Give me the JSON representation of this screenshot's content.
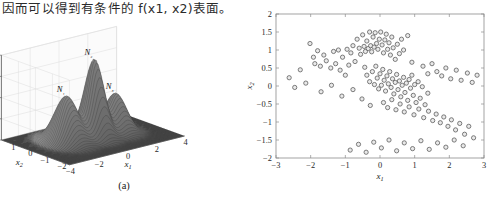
{
  "page": {
    "body_text": "因而可以得到有条件的 f(x1, x2)表面。"
  },
  "figure": {
    "panels": [
      {
        "id": "panel-a",
        "caption": "(a)",
        "type": "surface3d",
        "zlabel": "p(x₁,x₂)",
        "xlabel": "x₁",
        "ylabel": "x₂",
        "peak_labels": [
          "N₁",
          "N₂",
          "N₃"
        ]
      },
      {
        "id": "panel-b",
        "caption": "(b)",
        "type": "scatter",
        "xlabel": "x₁",
        "ylabel": "x₂"
      }
    ]
  },
  "chart_data": [
    {
      "type": "surface",
      "panel": "(a)",
      "title": "",
      "xlabel": "x₁",
      "ylabel": "x₂",
      "zlabel": "p(x₁,x₂)",
      "xlim": [
        -4,
        4
      ],
      "ylim": [
        -2,
        2
      ],
      "zlim": [
        0,
        0.4
      ],
      "xticks": [
        -4,
        -2,
        0,
        2,
        4
      ],
      "yticks": [
        -2,
        -1,
        0,
        1,
        2
      ],
      "zticks": [
        0,
        0.1,
        0.2,
        0.3,
        0.4
      ],
      "grid": true,
      "colormap": "grayscale",
      "annotations": [
        {
          "text": "N₁",
          "x": -1.6,
          "y": 0.2,
          "z": 0.22
        },
        {
          "text": "N₂",
          "x": 0.1,
          "y": 0.0,
          "z": 0.37
        },
        {
          "text": "N₃",
          "x": 1.7,
          "y": 0.1,
          "z": 0.18
        }
      ],
      "components": [
        {
          "name": "N₁",
          "mean": [
            -1.6,
            0.2
          ],
          "peak_height": 0.22,
          "sigma": [
            0.55,
            0.55
          ]
        },
        {
          "name": "N₂",
          "mean": [
            0.1,
            0.0
          ],
          "peak_height": 0.37,
          "sigma": [
            0.45,
            0.45
          ]
        },
        {
          "name": "N₃",
          "mean": [
            1.7,
            0.1
          ],
          "peak_height": 0.18,
          "sigma": [
            0.5,
            0.5
          ]
        }
      ]
    },
    {
      "type": "scatter",
      "panel": "(b)",
      "title": "",
      "xlabel": "x₁",
      "ylabel": "x₂",
      "xlim": [
        -3,
        3
      ],
      "ylim": [
        -2,
        2
      ],
      "xticks": [
        -3,
        -2,
        -1,
        0,
        1,
        2,
        3
      ],
      "yticks": [
        -2,
        -1.5,
        -1,
        -0.5,
        0,
        0.5,
        1,
        1.5,
        2
      ],
      "grid": false,
      "marker": "circle-open",
      "marker_size": 3.4,
      "marker_color": "#555555",
      "points": [
        [
          -2.62,
          0.23
        ],
        [
          -2.3,
          0.45
        ],
        [
          -2.02,
          1.18
        ],
        [
          -1.92,
          0.8
        ],
        [
          -1.88,
          0.62
        ],
        [
          -1.8,
          0.98
        ],
        [
          -1.72,
          0.55
        ],
        [
          -1.62,
          0.86
        ],
        [
          -1.55,
          0.7
        ],
        [
          -1.42,
          0.5
        ],
        [
          -1.34,
          0.96
        ],
        [
          -1.28,
          0.62
        ],
        [
          -1.2,
          1.0
        ],
        [
          -1.15,
          0.44
        ],
        [
          -1.08,
          0.8
        ],
        [
          -1.0,
          0.3
        ],
        [
          -0.95,
          1.02
        ],
        [
          -0.9,
          0.58
        ],
        [
          -0.84,
          0.92
        ],
        [
          -0.78,
          1.12
        ],
        [
          -0.72,
          0.68
        ],
        [
          -0.66,
          1.3
        ],
        [
          -0.6,
          1.05
        ],
        [
          -0.56,
          0.88
        ],
        [
          -0.5,
          1.42
        ],
        [
          -0.46,
          1.1
        ],
        [
          -0.42,
          0.96
        ],
        [
          -0.38,
          1.25
        ],
        [
          -0.34,
          1.04
        ],
        [
          -0.3,
          1.5
        ],
        [
          -0.27,
          1.12
        ],
        [
          -0.24,
          0.95
        ],
        [
          -0.2,
          1.36
        ],
        [
          -0.17,
          1.08
        ],
        [
          -0.14,
          1.48
        ],
        [
          -0.1,
          1.18
        ],
        [
          -0.06,
          1.02
        ],
        [
          -0.02,
          1.3
        ],
        [
          0.02,
          1.5
        ],
        [
          0.06,
          1.14
        ],
        [
          0.1,
          0.92
        ],
        [
          0.14,
          1.28
        ],
        [
          0.18,
          1.44
        ],
        [
          0.22,
          1.02
        ],
        [
          0.26,
          1.2
        ],
        [
          0.3,
          0.86
        ],
        [
          0.34,
          1.36
        ],
        [
          0.38,
          1.06
        ],
        [
          0.44,
          0.74
        ],
        [
          0.5,
          1.16
        ],
        [
          0.56,
          0.9
        ],
        [
          0.62,
          1.3
        ],
        [
          0.68,
          1.0
        ],
        [
          0.8,
          1.4
        ],
        [
          0.92,
          0.66
        ],
        [
          -0.44,
          0.52
        ],
        [
          -0.38,
          0.3
        ],
        [
          -0.3,
          0.12
        ],
        [
          -0.22,
          0.4
        ],
        [
          -0.16,
          0.04
        ],
        [
          -0.12,
          0.55
        ],
        [
          -0.08,
          0.22
        ],
        [
          -0.04,
          -0.08
        ],
        [
          0.0,
          0.34
        ],
        [
          0.04,
          0.02
        ],
        [
          0.08,
          0.46
        ],
        [
          0.12,
          0.16
        ],
        [
          0.16,
          -0.14
        ],
        [
          0.2,
          0.28
        ],
        [
          0.24,
          0.06
        ],
        [
          0.28,
          0.4
        ],
        [
          0.32,
          -0.04
        ],
        [
          0.36,
          0.2
        ],
        [
          0.4,
          -0.22
        ],
        [
          0.44,
          0.1
        ],
        [
          0.48,
          0.32
        ],
        [
          0.52,
          -0.1
        ],
        [
          0.56,
          0.14
        ],
        [
          0.6,
          -0.3
        ],
        [
          0.64,
          0.02
        ],
        [
          0.68,
          0.24
        ],
        [
          0.72,
          -0.18
        ],
        [
          0.76,
          0.08
        ],
        [
          0.8,
          -0.4
        ],
        [
          0.84,
          0.18
        ],
        [
          0.88,
          -0.06
        ],
        [
          0.92,
          0.3
        ],
        [
          0.96,
          -0.26
        ],
        [
          1.0,
          0.04
        ],
        [
          1.04,
          -0.46
        ],
        [
          1.1,
          0.12
        ],
        [
          1.16,
          -0.34
        ],
        [
          1.22,
          -0.02
        ],
        [
          1.3,
          -0.52
        ],
        [
          1.38,
          -0.2
        ],
        [
          0.1,
          -0.46
        ],
        [
          0.22,
          -0.6
        ],
        [
          0.34,
          -0.38
        ],
        [
          0.46,
          -0.66
        ],
        [
          0.58,
          -0.5
        ],
        [
          0.7,
          -0.72
        ],
        [
          0.84,
          -0.58
        ],
        [
          0.98,
          -0.8
        ],
        [
          1.12,
          -0.64
        ],
        [
          1.26,
          -0.88
        ],
        [
          1.4,
          -0.7
        ],
        [
          1.52,
          -0.96
        ],
        [
          1.62,
          -0.78
        ],
        [
          1.74,
          -1.02
        ],
        [
          1.84,
          -0.86
        ],
        [
          1.96,
          -1.12
        ],
        [
          2.06,
          -0.94
        ],
        [
          2.18,
          -1.22
        ],
        [
          2.3,
          -1.04
        ],
        [
          2.44,
          -1.34
        ],
        [
          2.56,
          -1.12
        ],
        [
          2.7,
          -1.44
        ],
        [
          -0.86,
          -1.78
        ],
        [
          -0.62,
          -1.62
        ],
        [
          -0.4,
          -1.84
        ],
        [
          -0.18,
          -1.56
        ],
        [
          0.04,
          -1.72
        ],
        [
          0.26,
          -1.5
        ],
        [
          0.48,
          -1.8
        ],
        [
          0.7,
          -1.58
        ],
        [
          0.94,
          -1.74
        ],
        [
          1.18,
          -1.52
        ],
        [
          1.42,
          -1.76
        ],
        [
          1.66,
          -1.58
        ],
        [
          1.9,
          -1.7
        ],
        [
          2.14,
          -1.5
        ],
        [
          2.4,
          -1.66
        ],
        [
          1.24,
          0.55
        ],
        [
          1.38,
          0.34
        ],
        [
          1.5,
          0.62
        ],
        [
          1.64,
          0.4
        ],
        [
          1.78,
          0.28
        ],
        [
          1.9,
          0.5
        ],
        [
          2.04,
          0.2
        ],
        [
          2.2,
          0.44
        ],
        [
          2.34,
          0.16
        ],
        [
          2.52,
          0.36
        ],
        [
          2.66,
          0.1
        ],
        [
          2.8,
          0.3
        ],
        [
          -2.46,
          -0.04
        ],
        [
          -2.14,
          0.08
        ],
        [
          -1.7,
          -0.16
        ],
        [
          -1.4,
          0.02
        ],
        [
          -1.1,
          -0.28
        ],
        [
          -0.78,
          -0.1
        ],
        [
          -0.52,
          -0.36
        ],
        [
          -0.28,
          -0.54
        ]
      ]
    }
  ]
}
